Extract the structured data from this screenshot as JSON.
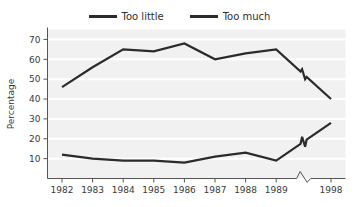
{
  "legend": {
    "position": "top-center",
    "entries": [
      {
        "label": "Too little",
        "color": "#2b2b2b",
        "icon": "line-swatch-icon"
      },
      {
        "label": "Too much",
        "color": "#2b2b2b",
        "icon": "line-swatch-icon"
      }
    ]
  },
  "chart_data": {
    "type": "line",
    "title": "",
    "subtitle": "",
    "xlabel": "",
    "ylabel": "Percentage",
    "x": [
      "1982",
      "1983",
      "1984",
      "1985",
      "1986",
      "1987",
      "1988",
      "1989",
      "1998"
    ],
    "categories": [
      "1982",
      "1983",
      "1984",
      "1985",
      "1986",
      "1987",
      "1988",
      "1989",
      "1998"
    ],
    "ylim": [
      0,
      75
    ],
    "yticks": [
      10,
      20,
      30,
      40,
      50,
      60,
      70
    ],
    "ytick_labels": [
      "10",
      "20",
      "30",
      "40",
      "50",
      "60",
      "70"
    ],
    "grid": "horizontal-white-on-gray",
    "axis_break": {
      "present": true,
      "between": [
        "1989",
        "1998"
      ],
      "marker": "zigzag",
      "applies_to": [
        "x-axis",
        "series-lines"
      ]
    },
    "series": [
      {
        "name": "Too much",
        "color": "#2b2b2b",
        "values": [
          46,
          56,
          65,
          64,
          68,
          60,
          63,
          65,
          40
        ]
      },
      {
        "name": "Too little",
        "color": "#2b2b2b",
        "values": [
          12,
          10,
          9,
          9,
          8,
          11,
          13,
          9,
          28
        ]
      }
    ],
    "legend_position": "top-center",
    "plot_background": "#f1f1f1",
    "gridline_color": "#ffffff"
  }
}
